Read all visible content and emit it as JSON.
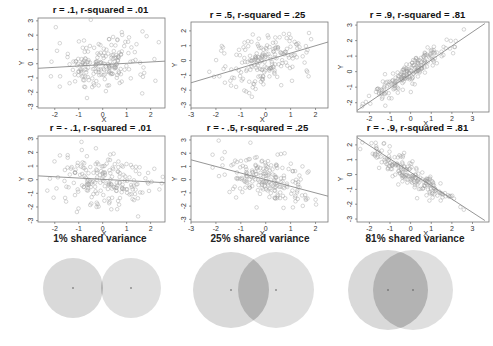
{
  "chart_data": [
    {
      "type": "scatter",
      "title": "r = .1, r-squared = .01",
      "xlabel": "X",
      "ylabel": "Y",
      "r": 0.1,
      "r_squared": 0.01,
      "xlim": [
        -2.7,
        2.6
      ],
      "ylim": [
        -3.1,
        3.2
      ],
      "xticks": [
        -2,
        -1,
        0,
        1,
        2
      ],
      "yticks": [
        -3,
        -2,
        -1,
        0,
        1,
        2,
        3
      ],
      "regression_line": {
        "x": [
          -2.7,
          2.6
        ],
        "y": [
          -0.32,
          0.18
        ]
      },
      "grid": false
    },
    {
      "type": "scatter",
      "title": "r = .5, r-squared = .25",
      "xlabel": "X",
      "ylabel": "Y",
      "r": 0.5,
      "r_squared": 0.25,
      "xlim": [
        -3,
        2.5
      ],
      "ylim": [
        -3.2,
        2.6
      ],
      "xticks": [
        -3,
        -2,
        -1,
        0,
        1,
        2
      ],
      "yticks": [
        -3,
        -2,
        -1,
        0,
        1,
        2
      ],
      "regression_line": {
        "x": [
          -3,
          2.5
        ],
        "y": [
          -1.5,
          1.25
        ]
      },
      "grid": false
    },
    {
      "type": "scatter",
      "title": "r = .9, r-squared = .81",
      "xlabel": "X",
      "ylabel": "Y",
      "r": 0.9,
      "r_squared": 0.81,
      "xlim": [
        -2.6,
        3.8
      ],
      "ylim": [
        -2.6,
        3.2
      ],
      "xticks": [
        -2,
        -1,
        0,
        1,
        2,
        3
      ],
      "yticks": [
        -2,
        -1,
        0,
        1,
        2,
        3
      ],
      "regression_line": {
        "x": [
          -2.6,
          3.6
        ],
        "y": [
          -2.5,
          3.1
        ]
      },
      "grid": false
    },
    {
      "type": "scatter",
      "title": "r = - .1, r-squared = .01",
      "xlabel": "X",
      "ylabel": "Y",
      "r": -0.1,
      "r_squared": 0.01,
      "xlim": [
        -2.7,
        2.6
      ],
      "ylim": [
        -3.1,
        3.2
      ],
      "xticks": [
        -2,
        -1,
        0,
        1,
        2
      ],
      "yticks": [
        -3,
        -2,
        -1,
        0,
        1,
        2,
        3
      ],
      "regression_line": {
        "x": [
          -2.7,
          2.6
        ],
        "y": [
          0.28,
          -0.22
        ]
      },
      "grid": false
    },
    {
      "type": "scatter",
      "title": "r = - .5, r-squared = .25",
      "xlabel": "X",
      "ylabel": "Y",
      "r": -0.5,
      "r_squared": 0.25,
      "xlim": [
        -3,
        2.5
      ],
      "ylim": [
        -3.2,
        3.3
      ],
      "xticks": [
        -3,
        -2,
        -1,
        0,
        1,
        2
      ],
      "yticks": [
        -3,
        -2,
        -1,
        0,
        1,
        2,
        3
      ],
      "regression_line": {
        "x": [
          -3,
          2.5
        ],
        "y": [
          1.5,
          -1.25
        ]
      },
      "grid": false
    },
    {
      "type": "scatter",
      "title": "r = - .9, r-squared = .81",
      "xlabel": "X",
      "ylabel": "Y",
      "r": -0.9,
      "r_squared": 0.81,
      "xlim": [
        -2.6,
        3.8
      ],
      "ylim": [
        -3.2,
        2.6
      ],
      "xticks": [
        -2,
        -1,
        0,
        1,
        2,
        3
      ],
      "yticks": [
        -3,
        -2,
        -1,
        0,
        1,
        2
      ],
      "regression_line": {
        "x": [
          -2.6,
          3.6
        ],
        "y": [
          2.5,
          -3.1
        ]
      },
      "grid": false
    },
    {
      "type": "diagram",
      "subtype": "venn",
      "panels": [
        {
          "caption": "1% shared variance",
          "shared_variance_pct": 1
        },
        {
          "caption": "25% shared variance",
          "shared_variance_pct": 25
        },
        {
          "caption": "81% shared variance",
          "shared_variance_pct": 81
        }
      ]
    }
  ],
  "plots": [
    {
      "title": "r = .1, r-squared = .01",
      "xlabel": "X",
      "ylabel": "Y"
    },
    {
      "title": "r = .5, r-squared = .25",
      "xlabel": "X",
      "ylabel": "Y"
    },
    {
      "title": "r = .9, r-squared = .81",
      "xlabel": "X",
      "ylabel": "Y"
    },
    {
      "title": "r = - .1, r-squared = .01",
      "xlabel": "X",
      "ylabel": "Y"
    },
    {
      "title": "r = - .5, r-squared = .25",
      "xlabel": "X",
      "ylabel": "Y"
    },
    {
      "title": "r = - .9, r-squared = .81",
      "xlabel": "X",
      "ylabel": "Y"
    }
  ],
  "venn": [
    {
      "caption": "1% shared variance"
    },
    {
      "caption": "25% shared variance"
    },
    {
      "caption": "81% shared variance"
    }
  ],
  "colors": {
    "point": "#9a9a9a",
    "line": "#8a8a8a",
    "axis": "#555555",
    "circle": "#d9d9d9",
    "overlap": "#b3b3b3"
  }
}
